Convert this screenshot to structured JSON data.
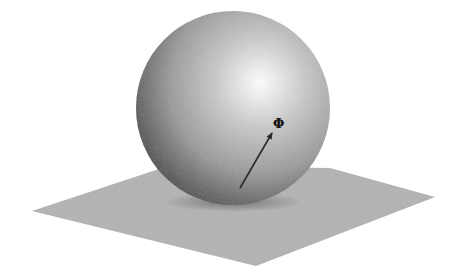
{
  "diagram": {
    "colors": {
      "background": "#ffffff",
      "plane": "#b3b3b3",
      "sphere_light": "#ffffff",
      "sphere_mid": "#b8b8b8",
      "sphere_dark": "#2e2e2e",
      "arrow": "#2a2a2a",
      "label": "#111111"
    },
    "sphere": {
      "cx": 233,
      "cy": 108,
      "r": 97,
      "highlight_x": 257,
      "highlight_y": 80
    },
    "plane": {
      "points": [
        [
          32,
          211
        ],
        [
          168,
          166
        ],
        [
          330,
          168
        ],
        [
          435,
          197
        ],
        [
          256,
          266
        ]
      ]
    },
    "arrow": {
      "x1": 240,
      "y1": 188,
      "x2": 272,
      "y2": 133
    },
    "label": {
      "text": "Φ",
      "x": 273,
      "y": 117
    }
  }
}
